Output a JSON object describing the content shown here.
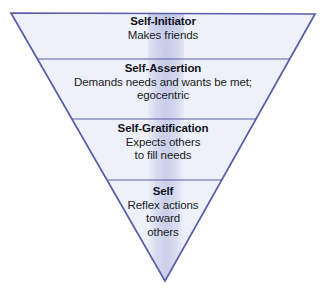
{
  "diagram": {
    "name": "inverted-triangle-self-development",
    "shape": "inverted-triangle",
    "colors": {
      "background": "#ffffff",
      "fill": "#eef1f9",
      "border": "#5a5ea6",
      "divider": "#5a5ea6",
      "center_band": "#b9bfe4",
      "text": "#1b1b23"
    },
    "geometry": {
      "top_left": [
        11,
        13
      ],
      "top_right": [
        315,
        14
      ],
      "apex": [
        165,
        281
      ],
      "divider_y": [
        59,
        119,
        180
      ]
    },
    "tiers": [
      {
        "id": "self-initiator",
        "title": "Self-Initiator",
        "lines": [
          "Makes friends"
        ]
      },
      {
        "id": "self-assertion",
        "title": "Self-Assertion",
        "lines": [
          "Demands needs and wants be met;",
          "egocentric"
        ]
      },
      {
        "id": "self-gratification",
        "title": "Self-Gratification",
        "lines": [
          "Expects others",
          "to fill needs"
        ]
      },
      {
        "id": "self",
        "title": "Self",
        "lines": [
          "Reflex actions",
          "toward",
          "others"
        ]
      }
    ]
  }
}
